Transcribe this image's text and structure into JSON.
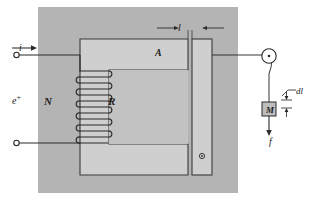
{
  "figure": {
    "colors": {
      "panel_fill": "#b4b4b4",
      "core_fill": "#cfcfcf",
      "inner_fill": "#c2c2c2",
      "stroke": "#3a3a3a",
      "wire": "#2b2b2b",
      "mass_fill": "#bdbdbd",
      "background": "#ffffff"
    },
    "labels": {
      "coil_turns": "N",
      "reluctance": "R",
      "area": "A",
      "current": "i",
      "emf": "e",
      "emf_superscript": "+",
      "gap_length": "l",
      "displacement": "dl",
      "mass": "M",
      "force": "f"
    },
    "icons": {
      "terminal_top": "open-circle-terminal",
      "terminal_bottom": "open-circle-terminal",
      "pulley": "pulley-wheel-icon",
      "armature_pivot": "pivot-dot-icon",
      "current_arrow": "arrow-right-icon",
      "force_arrow": "arrow-down-icon",
      "gap_dimension_arrows": "dimension-arrows-inward",
      "dl_dimension_arrows": "dimension-arrows-vertical"
    },
    "geometry": {
      "panel": {
        "x": 38,
        "y": 7,
        "w": 200,
        "h": 186
      },
      "core_outer": {
        "x": 80,
        "y": 39,
        "w": 108,
        "h": 136
      },
      "core_inner": {
        "x": 109,
        "y": 70,
        "w": 79,
        "h": 74
      },
      "armature": {
        "x": 192,
        "y": 39,
        "w": 20,
        "h": 136
      },
      "coil": {
        "x": 78,
        "y": 69,
        "turns": 8
      },
      "mass_box": {
        "x": 262,
        "y": 102,
        "w": 14,
        "h": 14
      }
    }
  }
}
